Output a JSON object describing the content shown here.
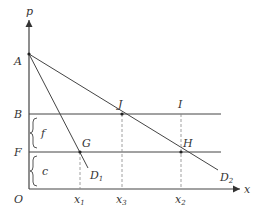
{
  "diagram": {
    "title": "",
    "axes": {
      "y_label": "p",
      "x_label": "x",
      "origin_label": "O"
    },
    "y_points": {
      "A": "A",
      "B": "B",
      "F": "F"
    },
    "braces": {
      "upper": "f",
      "lower": "c"
    },
    "intersections": {
      "J": "J",
      "I": "I",
      "G": "G",
      "H": "H"
    },
    "demand_curves": {
      "D1": "D",
      "D1_sub": "1",
      "D2": "D",
      "D2_sub": "2"
    },
    "x_ticks": [
      {
        "name": "x",
        "sub": "1"
      },
      {
        "name": "x",
        "sub": "3"
      },
      {
        "name": "x",
        "sub": "2"
      }
    ],
    "colors": {
      "line": "#444444",
      "dashed": "#888888",
      "text": "#333333"
    }
  }
}
